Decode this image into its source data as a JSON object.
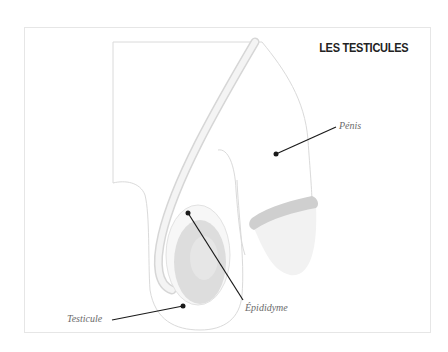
{
  "title": "LES TESTICULES",
  "labels": {
    "penis": "Pénis",
    "epididyme": "Épididyme",
    "testicule": "Testicule"
  },
  "colors": {
    "outline": "#d9d9d9",
    "duct": "#ececec",
    "testis": "#dcdcdc",
    "glans_band": "#cfcfcf",
    "leader": "#1a1a1a"
  }
}
